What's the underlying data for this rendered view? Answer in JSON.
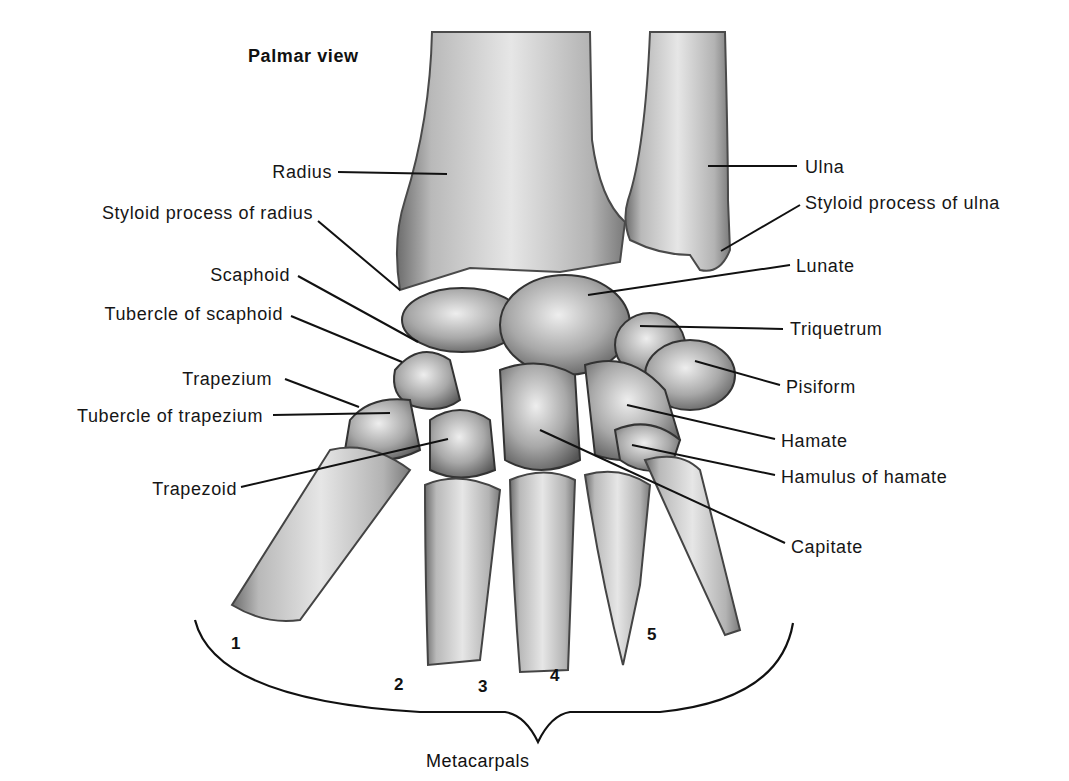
{
  "figure": {
    "title": "Palmar view",
    "labels_left": [
      {
        "id": "radius",
        "text": "Radius"
      },
      {
        "id": "styloid-radius",
        "text": "Styloid process of radius"
      },
      {
        "id": "scaphoid",
        "text": "Scaphoid"
      },
      {
        "id": "tubercle-scaphoid",
        "text": "Tubercle of scaphoid"
      },
      {
        "id": "trapezium",
        "text": "Trapezium"
      },
      {
        "id": "tubercle-trapezium",
        "text": "Tubercle of trapezium"
      },
      {
        "id": "trapezoid",
        "text": "Trapezoid"
      }
    ],
    "labels_right": [
      {
        "id": "ulna",
        "text": "Ulna"
      },
      {
        "id": "styloid-ulna",
        "text": "Styloid process of ulna"
      },
      {
        "id": "lunate",
        "text": "Lunate"
      },
      {
        "id": "triquetrum",
        "text": "Triquetrum"
      },
      {
        "id": "pisiform",
        "text": "Pisiform"
      },
      {
        "id": "hamate",
        "text": "Hamate"
      },
      {
        "id": "hamulus",
        "text": "Hamulus of hamate"
      },
      {
        "id": "capitate",
        "text": "Capitate"
      }
    ],
    "metacarpal_numbers": [
      "1",
      "2",
      "3",
      "4",
      "5"
    ],
    "group_label": "Metacarpals"
  }
}
